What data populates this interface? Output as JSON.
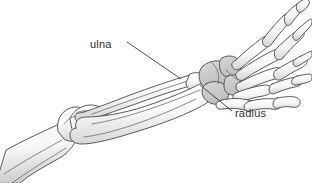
{
  "figure": {
    "background_color": "#ffffff",
    "line_color": "#4a4a4a",
    "label_color": "#2e2e2e",
    "bone_fill_light": "#fbfbfb",
    "bone_fill_shadow": "#d9d9d9",
    "carpal_fill": "#c9c9c9"
  },
  "labels": [
    {
      "id": "ulna",
      "text": "ulna",
      "x": 90,
      "y": 48,
      "leader_from": [
        127,
        42
      ],
      "leader_to": [
        181,
        79
      ]
    },
    {
      "id": "radius",
      "text": "radius",
      "x": 235,
      "y": 117,
      "leader_from": [
        200,
        85
      ],
      "leader_to": [
        232,
        111
      ]
    }
  ],
  "structures": [
    {
      "id": "humerus",
      "name": "humerus shaft"
    },
    {
      "id": "elbow-joint",
      "name": "elbow joint"
    },
    {
      "id": "ulna-bone",
      "name": "ulna"
    },
    {
      "id": "radius-bone",
      "name": "radius"
    },
    {
      "id": "carpals",
      "name": "carpal bones"
    },
    {
      "id": "metacarpals",
      "name": "metacarpal bones"
    },
    {
      "id": "phalanges",
      "name": "finger phalanges"
    },
    {
      "id": "thumb",
      "name": "thumb phalanges"
    }
  ]
}
